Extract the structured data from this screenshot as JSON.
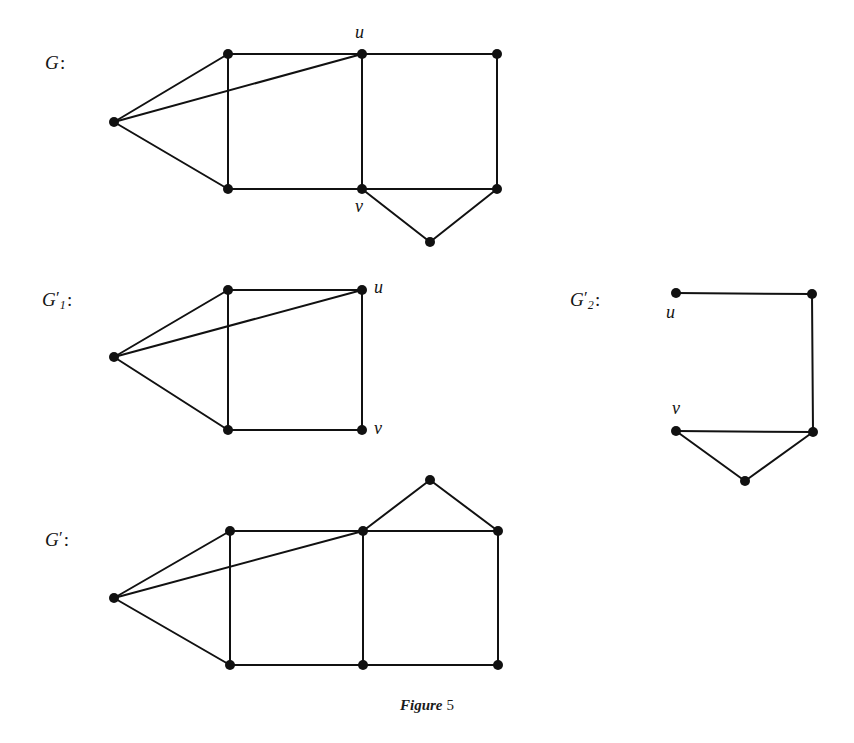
{
  "figure": {
    "caption_word": "Figure",
    "caption_number": "5",
    "background_color": "#ffffff",
    "ink_color": "#111111",
    "vertex_radius": 5,
    "edge_width": 2
  },
  "graphs": [
    {
      "id": "G",
      "label_text": "G",
      "label_prime": "",
      "label_subscript": "",
      "label_colon": ":",
      "label_pos": {
        "x": 45,
        "y": 52
      },
      "vertices": [
        {
          "name": "left-apex",
          "x": 114,
          "y": 122,
          "label": ""
        },
        {
          "name": "top-left",
          "x": 228,
          "y": 54,
          "label": ""
        },
        {
          "name": "u",
          "x": 362,
          "y": 54,
          "label": "u",
          "label_x": 355,
          "label_y": 22
        },
        {
          "name": "top-right",
          "x": 497,
          "y": 54,
          "label": ""
        },
        {
          "name": "bottom-left",
          "x": 228,
          "y": 189,
          "label": ""
        },
        {
          "name": "v",
          "x": 362,
          "y": 189,
          "label": "v",
          "label_x": 355,
          "label_y": 196
        },
        {
          "name": "bottom-right",
          "x": 497,
          "y": 189,
          "label": ""
        },
        {
          "name": "tip",
          "x": 430,
          "y": 242,
          "label": ""
        }
      ],
      "edges": [
        [
          "left-apex",
          "top-left"
        ],
        [
          "left-apex",
          "u"
        ],
        [
          "left-apex",
          "bottom-left"
        ],
        [
          "top-left",
          "u"
        ],
        [
          "u",
          "top-right"
        ],
        [
          "top-left",
          "bottom-left"
        ],
        [
          "u",
          "v"
        ],
        [
          "top-right",
          "bottom-right"
        ],
        [
          "bottom-left",
          "v"
        ],
        [
          "v",
          "bottom-right"
        ],
        [
          "v",
          "tip"
        ],
        [
          "tip",
          "bottom-right"
        ]
      ]
    },
    {
      "id": "G1prime",
      "label_text": "G",
      "label_prime": "′",
      "label_subscript": "1",
      "label_colon": ":",
      "label_pos": {
        "x": 42,
        "y": 288
      },
      "vertices": [
        {
          "name": "left-apex",
          "x": 114,
          "y": 357,
          "label": ""
        },
        {
          "name": "top-left",
          "x": 228,
          "y": 290,
          "label": ""
        },
        {
          "name": "u",
          "x": 362,
          "y": 290,
          "label": "u",
          "label_x": 374,
          "label_y": 277
        },
        {
          "name": "bottom-left",
          "x": 228,
          "y": 430,
          "label": ""
        },
        {
          "name": "v",
          "x": 362,
          "y": 430,
          "label": "v",
          "label_x": 374,
          "label_y": 418
        }
      ],
      "edges": [
        [
          "left-apex",
          "top-left"
        ],
        [
          "left-apex",
          "u"
        ],
        [
          "left-apex",
          "bottom-left"
        ],
        [
          "top-left",
          "u"
        ],
        [
          "top-left",
          "bottom-left"
        ],
        [
          "u",
          "v"
        ],
        [
          "bottom-left",
          "v"
        ]
      ]
    },
    {
      "id": "G2prime",
      "label_text": "G",
      "label_prime": "′",
      "label_subscript": "2",
      "label_colon": ":",
      "label_pos": {
        "x": 570,
        "y": 288
      },
      "vertices": [
        {
          "name": "u",
          "x": 676,
          "y": 293,
          "label": "u",
          "label_x": 666,
          "label_y": 302
        },
        {
          "name": "top-right",
          "x": 812,
          "y": 294,
          "label": ""
        },
        {
          "name": "v",
          "x": 676,
          "y": 431,
          "label": "v",
          "label_x": 672,
          "label_y": 398
        },
        {
          "name": "bottom-right",
          "x": 813,
          "y": 432,
          "label": ""
        },
        {
          "name": "tip",
          "x": 745,
          "y": 481,
          "label": ""
        }
      ],
      "edges": [
        [
          "u",
          "top-right"
        ],
        [
          "top-right",
          "bottom-right"
        ],
        [
          "v",
          "bottom-right"
        ],
        [
          "v",
          "tip"
        ],
        [
          "tip",
          "bottom-right"
        ]
      ]
    },
    {
      "id": "Gprime",
      "label_text": "G",
      "label_prime": "′",
      "label_subscript": "",
      "label_colon": ":",
      "label_pos": {
        "x": 45,
        "y": 528
      },
      "vertices": [
        {
          "name": "left-apex",
          "x": 114,
          "y": 598,
          "label": ""
        },
        {
          "name": "top-left",
          "x": 230,
          "y": 531,
          "label": ""
        },
        {
          "name": "top-mid",
          "x": 363,
          "y": 531,
          "label": ""
        },
        {
          "name": "top-right",
          "x": 498,
          "y": 531,
          "label": ""
        },
        {
          "name": "apex",
          "x": 430,
          "y": 480,
          "label": ""
        },
        {
          "name": "bottom-left",
          "x": 230,
          "y": 665,
          "label": ""
        },
        {
          "name": "bottom-mid",
          "x": 363,
          "y": 665,
          "label": ""
        },
        {
          "name": "bottom-right",
          "x": 498,
          "y": 665,
          "label": ""
        }
      ],
      "edges": [
        [
          "left-apex",
          "top-left"
        ],
        [
          "left-apex",
          "top-mid"
        ],
        [
          "left-apex",
          "bottom-left"
        ],
        [
          "top-left",
          "top-mid"
        ],
        [
          "top-mid",
          "top-right"
        ],
        [
          "top-mid",
          "apex"
        ],
        [
          "apex",
          "top-right"
        ],
        [
          "top-left",
          "bottom-left"
        ],
        [
          "top-mid",
          "bottom-mid"
        ],
        [
          "top-right",
          "bottom-right"
        ],
        [
          "bottom-left",
          "bottom-mid"
        ],
        [
          "bottom-mid",
          "bottom-right"
        ]
      ]
    }
  ],
  "caption_pos": {
    "x": 427,
    "y": 697
  }
}
